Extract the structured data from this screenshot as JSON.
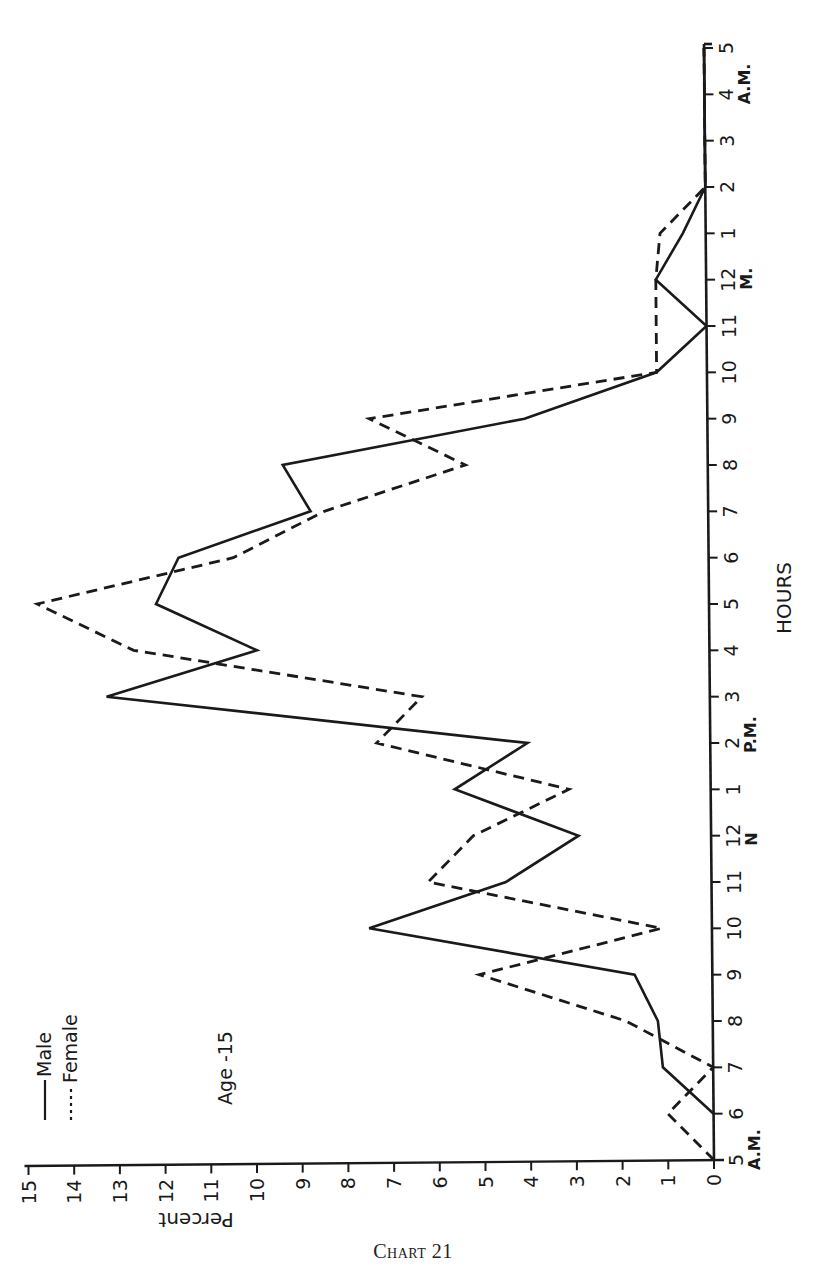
{
  "caption": "Chart 21",
  "chart_data": {
    "type": "line",
    "title": "Chart 21",
    "subtitle": "Age -15",
    "orientation": "rotated 90° counter-clockwise (hours axis vertical on right, percent axis horizontal at bottom)",
    "xlabel": "HOURS",
    "ylabel": "Percent",
    "ylim": [
      0,
      15
    ],
    "yticks": [
      "0",
      "1",
      "2",
      "3",
      "4",
      "5",
      "6",
      "7",
      "8",
      "9",
      "10",
      "11",
      "12",
      "13",
      "14",
      "15"
    ],
    "categories": [
      "5",
      "6",
      "7",
      "8",
      "9",
      "10",
      "11",
      "12",
      "1",
      "2",
      "3",
      "4",
      "5",
      "6",
      "7",
      "8",
      "9",
      "10",
      "11",
      "12",
      "1",
      "2",
      "3",
      "4",
      "5"
    ],
    "category_period_labels": [
      {
        "index": 0,
        "label": "A.M."
      },
      {
        "index": 7,
        "label": "N"
      },
      {
        "index": 9,
        "label": "P.M."
      },
      {
        "index": 19,
        "label": "M."
      },
      {
        "index": 23,
        "label": "A.M."
      }
    ],
    "grid": false,
    "legend_position": "upper-left (rotated)",
    "series": [
      {
        "name": "Male",
        "style": "solid",
        "values": [
          null,
          0,
          1.1,
          1.2,
          1.7,
          7.5,
          4.5,
          2.9,
          5.6,
          4.0,
          13.2,
          9.9,
          12.1,
          11.6,
          8.7,
          9.3,
          4.0,
          1.1,
          0,
          1.1,
          0.5,
          0,
          0,
          0,
          0
        ]
      },
      {
        "name": "Female",
        "style": "dashed",
        "values": [
          0,
          1.0,
          0,
          1.9,
          5.1,
          1.1,
          6.2,
          5.2,
          3.1,
          7.3,
          6.3,
          12.6,
          14.7,
          10.4,
          8.4,
          5.3,
          7.4,
          1.1,
          1.1,
          1.1,
          1.0,
          0,
          0,
          0,
          0
        ]
      }
    ]
  },
  "legend": {
    "items": [
      {
        "label": "Male",
        "style": "solid"
      },
      {
        "label": "Female",
        "style": "dashed"
      }
    ]
  },
  "annotation": "Age -15",
  "axis_titles": {
    "x": "HOURS",
    "y": "Percent"
  },
  "colors": {
    "ink": "#1a1a1a",
    "background": "#ffffff"
  }
}
